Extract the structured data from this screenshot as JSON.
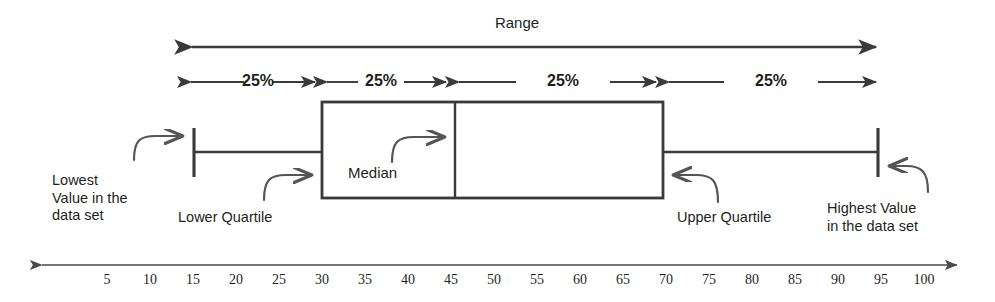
{
  "diagram": {
    "title_label": "Range",
    "median_label": "Median",
    "quartile_percent_labels": [
      "25%",
      "25%",
      "25%",
      "25%"
    ],
    "callouts": {
      "lowest": "Lowest\nValue in the\ndata set",
      "lower_quartile": "Lower Quartile",
      "upper_quartile": "Upper Quartile",
      "highest": "Highest Value\nin the data set"
    },
    "colors": {
      "stroke": "#3a3a3a",
      "axis": "#4a4a4a",
      "text": "#231f20",
      "background": "#ffffff"
    }
  },
  "chart_data": {
    "type": "box",
    "title": "Range",
    "xlabel": "",
    "ylabel": "",
    "xlim": [
      0,
      100
    ],
    "grid": false,
    "legend": false,
    "axis_ticks": [
      5,
      10,
      15,
      20,
      25,
      30,
      35,
      40,
      45,
      50,
      55,
      60,
      65,
      70,
      75,
      80,
      85,
      90,
      95,
      100
    ],
    "axis_tick_step": 5,
    "box": {
      "minimum": 15,
      "lower_quartile": 30,
      "median": 45,
      "upper_quartile": 70,
      "maximum": 95
    },
    "annotations": [
      {
        "text": "Range",
        "from": 15,
        "to": 95
      },
      {
        "text": "25%",
        "from": 15,
        "to": 30
      },
      {
        "text": "25%",
        "from": 30,
        "to": 45
      },
      {
        "text": "25%",
        "from": 45,
        "to": 70
      },
      {
        "text": "25%",
        "from": 70,
        "to": 95
      },
      {
        "text": "Lowest Value in the data set",
        "points_to": 15
      },
      {
        "text": "Lower Quartile",
        "points_to": 30
      },
      {
        "text": "Median",
        "points_to": 45
      },
      {
        "text": "Upper Quartile",
        "points_to": 70
      },
      {
        "text": "Highest Value in the data set",
        "points_to": 95
      }
    ]
  }
}
